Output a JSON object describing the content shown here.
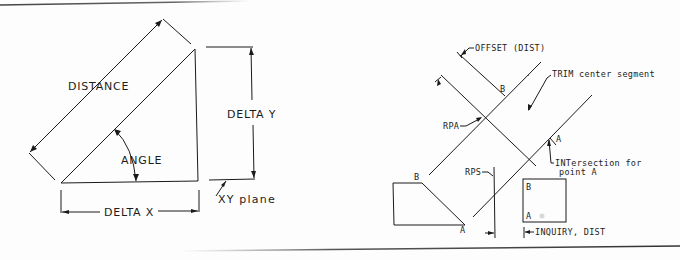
{
  "page": {
    "top_rule_color": "#555555",
    "bottom_rule_color": "#444444",
    "ink_color": "#1a1a1a"
  },
  "figure_left": {
    "labels": {
      "distance": "DISTANCE",
      "delta_y": "DELTA Y",
      "angle": "ANGLE",
      "delta_x": "DELTA X",
      "xy_plane": "XY plane"
    }
  },
  "figure_right": {
    "labels": {
      "offset": "OFFSET (DIST)",
      "trim": "TRIM center segment",
      "rpa": "RPA",
      "rps": "RPS",
      "point_b_top": "B",
      "point_a_right": "A",
      "intersection_line1": "INTersection for",
      "intersection_line2": "point A",
      "poly_b": "B",
      "poly_a": "A",
      "box_b": "B",
      "box_a": "A",
      "inquiry": "INQUIRY, DIST"
    }
  }
}
